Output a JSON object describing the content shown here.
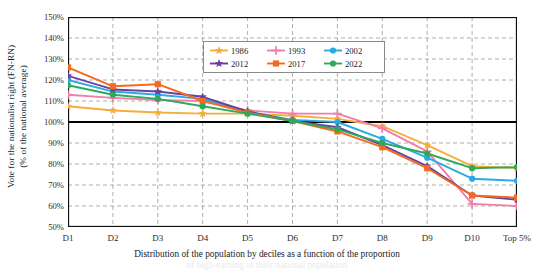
{
  "axes": {
    "y_title_line1": "Vote for the nationalist right (FN-RN)",
    "y_title_line2": "(% of the national average)",
    "y_ticks": [
      "150%",
      "140%",
      "130%",
      "120%",
      "110%",
      "100%",
      "90%",
      "80%",
      "70%",
      "60%",
      "50%"
    ],
    "x_caption_line1": "Distribution of the population by deciles as a function of the proportion",
    "x_caption_line2": "of high-earning in their national population"
  },
  "legend": {
    "entries": [
      {
        "label": "1986",
        "color": "#F5AE3C",
        "marker": "star"
      },
      {
        "label": "1993",
        "color": "#F07EA8",
        "marker": "plus"
      },
      {
        "label": "2002",
        "color": "#29ABE2",
        "marker": "circle"
      },
      {
        "label": "2012",
        "color": "#6B3FA0",
        "marker": "star"
      },
      {
        "label": "2017",
        "color": "#F26B21",
        "marker": "square"
      },
      {
        "label": "2022",
        "color": "#2EA95B",
        "marker": "circle"
      }
    ]
  },
  "chart_data": {
    "type": "line",
    "title": "",
    "xlabel": "Distribution of the population by deciles as a function of the proportion",
    "ylabel": "Vote for the nationalist right (FN-RN) (% of the national average)",
    "ylim": [
      50,
      150
    ],
    "ytick_step": 10,
    "grid": true,
    "legend_position": "upper-center",
    "reference_line": 100,
    "categories": [
      "D1",
      "D2",
      "D3",
      "D4",
      "D5",
      "D6",
      "D7",
      "D8",
      "D9",
      "D10",
      "Top 5%"
    ],
    "series": [
      {
        "name": "1986",
        "color": "#F5AE3C",
        "marker": "star",
        "values": [
          107.5,
          105.5,
          104.5,
          104.0,
          104.0,
          103.0,
          101.5,
          98.0,
          89.0,
          79.0,
          78.0
        ]
      },
      {
        "name": "1993",
        "color": "#F07EA8",
        "marker": "plus",
        "values": [
          113.0,
          111.5,
          110.5,
          110.0,
          105.5,
          104.0,
          104.0,
          97.0,
          86.0,
          61.0,
          60.0
        ]
      },
      {
        "name": "2002",
        "color": "#29ABE2",
        "marker": "circle",
        "values": [
          120.0,
          114.5,
          113.0,
          111.0,
          105.0,
          101.0,
          100.0,
          92.0,
          83.0,
          73.0,
          72.0
        ]
      },
      {
        "name": "2012",
        "color": "#6B3FA0",
        "marker": "star",
        "values": [
          122.0,
          115.5,
          114.5,
          112.0,
          105.0,
          100.5,
          97.5,
          89.0,
          79.0,
          65.0,
          63.0
        ]
      },
      {
        "name": "2017",
        "color": "#F26B21",
        "marker": "square",
        "values": [
          126.0,
          117.0,
          118.0,
          110.0,
          104.5,
          100.5,
          95.5,
          88.0,
          78.0,
          65.0,
          64.0
        ]
      },
      {
        "name": "2022",
        "color": "#2EA95B",
        "marker": "circle",
        "values": [
          117.5,
          113.0,
          111.0,
          107.5,
          104.0,
          100.5,
          96.5,
          90.0,
          85.0,
          78.0,
          78.5
        ]
      }
    ]
  }
}
